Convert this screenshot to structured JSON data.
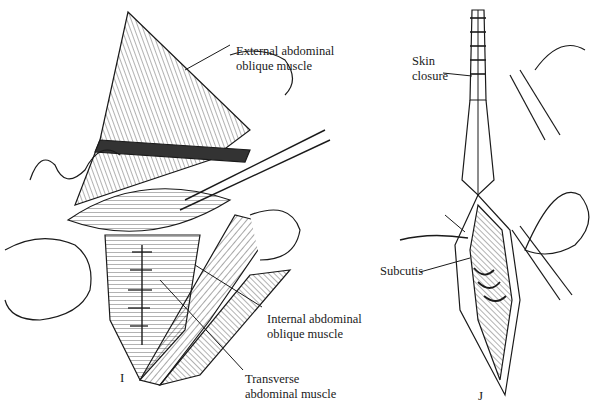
{
  "figure": {
    "panels": [
      {
        "id": "I",
        "letter": "I",
        "labels": {
          "external_oblique": [
            "External abdominal",
            "oblique muscle"
          ],
          "internal_oblique": [
            "Internal abdominal",
            "oblique muscle"
          ],
          "transverse": [
            "Transverse",
            "abdominal muscle"
          ]
        }
      },
      {
        "id": "J",
        "letter": "J",
        "labels": {
          "skin_closure": [
            "Skin",
            "closure"
          ],
          "subcutis": [
            "Subcutis"
          ]
        }
      }
    ],
    "colors": {
      "ink": "#1a1a1a",
      "background": "#ffffff"
    }
  }
}
